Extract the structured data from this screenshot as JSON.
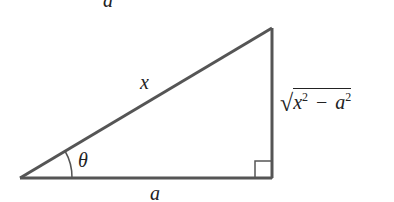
{
  "diagram": {
    "type": "right-triangle",
    "top_label": "a",
    "hypotenuse_label": "x",
    "angle_label": "θ",
    "base_label": "a",
    "vertical_side": {
      "radical": "√",
      "var1": "x",
      "exp1": "2",
      "operator": "−",
      "var2": "a",
      "exp2": "2"
    },
    "stroke_color": "#555555"
  }
}
